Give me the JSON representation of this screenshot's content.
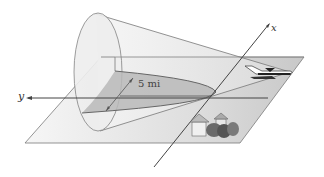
{
  "figure": {
    "axes": {
      "y_label": "y",
      "x_label": "x"
    },
    "annotation": {
      "distance_label": "5 mi"
    },
    "objects": [
      "cone",
      "plane",
      "airplane",
      "houses",
      "trees"
    ],
    "colors": {
      "cone_fill": "#e6e6e6",
      "plane_fill": "#d0d0d0",
      "section_fill": "#b8b8b8",
      "line": "#555555"
    }
  }
}
